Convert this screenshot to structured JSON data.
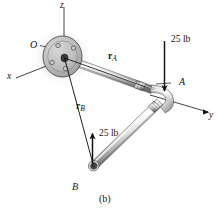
{
  "figure": {
    "caption": "(b)",
    "axes": [
      {
        "name": "z-axis",
        "label": "z"
      },
      {
        "name": "x-axis",
        "label": "x"
      },
      {
        "name": "y-axis",
        "label": "y"
      }
    ],
    "points": [
      {
        "name": "origin",
        "label": "O"
      },
      {
        "name": "elbow",
        "label": "A"
      },
      {
        "name": "free-end",
        "label": "B"
      }
    ],
    "vectors": [
      {
        "name": "position-vector-a",
        "symbol": "r",
        "subscript": "A"
      },
      {
        "name": "position-vector-b",
        "symbol": "r",
        "subscript": "B"
      }
    ],
    "forces": [
      {
        "name": "force-at-a",
        "label": "25 lb",
        "direction": "down"
      },
      {
        "name": "force-at-b",
        "label": "25 lb",
        "direction": "up"
      }
    ],
    "colors": {
      "ink": "#141414",
      "pipe_light": "#f2f2f2",
      "pipe_mid": "#b9b9b9",
      "pipe_dark": "#6e6e6e",
      "flange_fill": "#b5b5b5",
      "shadow": "#9a9a9a"
    }
  }
}
